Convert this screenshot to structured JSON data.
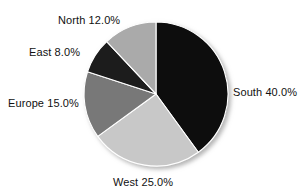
{
  "chart_data": {
    "type": "pie",
    "title": "",
    "subtitle": "",
    "xlabel": "",
    "ylabel": "",
    "legend_position": "none",
    "grid": false,
    "start_angle_deg": 0,
    "direction": "clockwise",
    "center": {
      "x": 156,
      "y": 94
    },
    "radius": 72,
    "categories": [
      "South",
      "West",
      "Europe",
      "East",
      "North"
    ],
    "values": [
      40.0,
      25.0,
      15.0,
      8.0,
      12.0
    ],
    "value_unit": "%",
    "slices": [
      {
        "name": "South",
        "value": 40.0,
        "label": "South 40.0%",
        "color": "#0a0a0a",
        "start_deg": 0,
        "end_deg": 144
      },
      {
        "name": "West",
        "value": 25.0,
        "label": "West 25.0%",
        "color": "#c8c8c8",
        "start_deg": 144,
        "end_deg": 234
      },
      {
        "name": "Europe",
        "value": 15.0,
        "label": "Europe 15.0%",
        "color": "#787878",
        "start_deg": 234,
        "end_deg": 288
      },
      {
        "name": "East",
        "value": 8.0,
        "label": "East 8.0%",
        "color": "#1a1a1a",
        "start_deg": 288,
        "end_deg": 316.8
      },
      {
        "name": "North",
        "value": 12.0,
        "label": "North 12.0%",
        "color": "#aaaaaa",
        "start_deg": 316.8,
        "end_deg": 360
      }
    ]
  },
  "style": {
    "background": "#ffffff",
    "separator_color": "#ffffff",
    "text_color": "#111111",
    "shadow_color": "#b4b4b4"
  }
}
